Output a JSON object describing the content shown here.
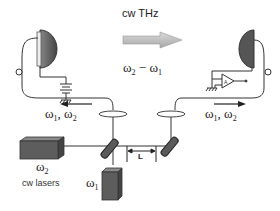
{
  "diagram": {
    "title": "cw THz",
    "difference_label": {
      "a": "ω",
      "a_sub": "2",
      "op": " − ",
      "b": "ω",
      "b_sub": "1"
    },
    "beam_left_label": {
      "a": "ω",
      "a_sub": "1",
      "sep": ", ",
      "b": "ω",
      "b_sub": "2"
    },
    "beam_right_label": {
      "a": "ω",
      "a_sub": "1",
      "sep": ", ",
      "b": "ω",
      "b_sub": "2"
    },
    "laser2_label": {
      "a": "ω",
      "a_sub": "2"
    },
    "laser1_label": {
      "a": "ω",
      "a_sub": "1"
    },
    "lasers_caption": "cw lasers",
    "delay_label": "L",
    "components": [
      "emitter-antenna",
      "bias-battery",
      "detector-antenna",
      "amplifier",
      "lens-left",
      "lens-right",
      "beamsplitter",
      "delay-mirror",
      "laser-omega1",
      "laser-omega2",
      "fiber-left",
      "fiber-right"
    ],
    "colors": {
      "line": "#333333",
      "component_fill": "#5a5a5a",
      "arrow_fill": "#bdbdbd"
    }
  }
}
